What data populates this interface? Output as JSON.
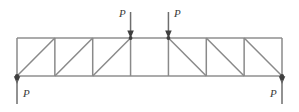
{
  "figure": {
    "width": 299,
    "height": 112,
    "background": "#ffffff",
    "line_color": "#8a8a8a",
    "chord_color": "#8f8f8f",
    "arrow_color": "#6e6e6e",
    "node_color": "#4a4a4a",
    "label_color": "#3a3a3a"
  },
  "truss": {
    "type": "planar-truss",
    "span_left_x": 17,
    "span_right_x": 282,
    "top_chord_y": 38,
    "bottom_chord_y": 76,
    "panel_count": 7,
    "panel_nodes_x": [
      17,
      54.86,
      92.71,
      130.57,
      168.43,
      206.29,
      244.14,
      282
    ],
    "diagonals": [
      {
        "panel": 1,
        "direction": "up-right"
      },
      {
        "panel": 2,
        "direction": "up-right"
      },
      {
        "panel": 3,
        "direction": "up-right"
      },
      {
        "panel": 4,
        "direction": "none"
      },
      {
        "panel": 5,
        "direction": "down-right"
      },
      {
        "panel": 6,
        "direction": "down-right"
      },
      {
        "panel": 7,
        "direction": "down-right"
      }
    ]
  },
  "loads": [
    {
      "id": "top-load-1",
      "label": "P",
      "node_x": 130.57,
      "node_y": 38,
      "direction": "down",
      "tail_y": 12,
      "label_side": "left",
      "label_x": 119,
      "label_y": 8
    },
    {
      "id": "top-load-2",
      "label": "P",
      "node_x": 168.43,
      "node_y": 38,
      "direction": "down",
      "tail_y": 12,
      "label_side": "right",
      "label_x": 174,
      "label_y": 8
    }
  ],
  "reactions": [
    {
      "id": "reaction-left",
      "label": "P",
      "node_x": 17,
      "node_y": 76,
      "direction": "down",
      "tip_y": 104,
      "label_side": "right",
      "label_x": 23,
      "label_y": 94
    },
    {
      "id": "reaction-right",
      "label": "P",
      "node_x": 282,
      "node_y": 76,
      "direction": "down",
      "tip_y": 104,
      "label_side": "left",
      "label_x": 270,
      "label_y": 94
    }
  ]
}
